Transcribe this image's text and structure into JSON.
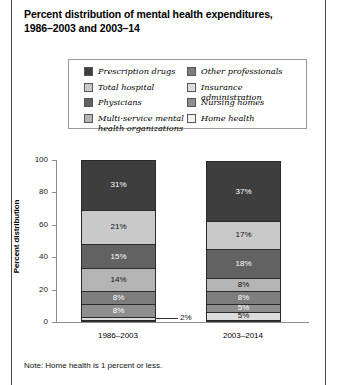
{
  "figure": {
    "title": "Percent distribution of mental health expenditures,\n1986–2003 and 2003–14",
    "note": "Note: Home health is 1 percent or less."
  },
  "legend": {
    "columns": [
      [
        {
          "label": "Prescription drugs",
          "color": "#3e3e3e",
          "swatch": "legend-swatch-prescription-drugs"
        },
        {
          "label": "Total hospital",
          "color": "#c9c9c9",
          "swatch": "legend-swatch-total-hospital"
        },
        {
          "label": "Physicians",
          "color": "#626262",
          "swatch": "legend-swatch-physicians"
        },
        {
          "label": "Multi-service mental\nhealth organizations",
          "color": "#b4b4b4",
          "swatch": "legend-swatch-multi-service-mental-health-organizations"
        }
      ],
      [
        {
          "label": "Other professionals",
          "color": "#7d7d7d",
          "swatch": "legend-swatch-other-professionals"
        },
        {
          "label": "Insurance administration",
          "color": "#dcdcdc",
          "swatch": "legend-swatch-insurance-administration"
        },
        {
          "label": "Nursing homes",
          "color": "#8f8f8f",
          "swatch": "legend-swatch-nursing-homes"
        },
        {
          "label": "Home health",
          "color": "#f2f2f2",
          "swatch": "legend-swatch-home-health"
        }
      ]
    ]
  },
  "axis": {
    "y_title": "Percent distribution",
    "y_ticks": [
      "0",
      "20",
      "40",
      "60",
      "80",
      "100"
    ]
  },
  "chart_data": {
    "type": "bar",
    "subtype": "stacked-bar-100",
    "title": "Percent distribution of mental health expenditures, 1986–2003 and 2003–14",
    "xlabel": "",
    "ylabel": "Percent distribution",
    "ylim": [
      0,
      100
    ],
    "yticks": [
      0,
      20,
      40,
      60,
      80,
      100
    ],
    "grid": false,
    "legend_position": "top",
    "note": "Home health is 1 percent or less.",
    "categories": [
      "1986–2003",
      "2003–2014"
    ],
    "series": [
      {
        "name": "Home health",
        "color": "#f2f2f2",
        "values": [
          1,
          1
        ],
        "labels": [
          "",
          "0%"
        ]
      },
      {
        "name": "Insurance administration",
        "color": "#dcdcdc",
        "values": [
          2,
          5
        ],
        "labels": [
          "2%",
          "5%"
        ]
      },
      {
        "name": "Nursing homes",
        "color": "#8f8f8f",
        "values": [
          8,
          5
        ],
        "labels": [
          "8%",
          "5%"
        ]
      },
      {
        "name": "Other professionals",
        "color": "#7d7d7d",
        "values": [
          8,
          8
        ],
        "labels": [
          "8%",
          "8%"
        ]
      },
      {
        "name": "Multi-service mental health organizations",
        "color": "#b4b4b4",
        "values": [
          14,
          8
        ],
        "labels": [
          "14%",
          "8%"
        ]
      },
      {
        "name": "Physicians",
        "color": "#626262",
        "values": [
          15,
          18
        ],
        "labels": [
          "15%",
          "18%"
        ]
      },
      {
        "name": "Total hospital",
        "color": "#c9c9c9",
        "values": [
          21,
          17
        ],
        "labels": [
          "21%",
          "17%"
        ]
      },
      {
        "name": "Prescription drugs",
        "color": "#3e3e3e",
        "values": [
          31,
          37
        ],
        "labels": [
          "31%",
          "37%"
        ]
      }
    ],
    "callouts": [
      {
        "text": "2%",
        "category": "1986–2003",
        "series": "Insurance administration"
      }
    ]
  }
}
